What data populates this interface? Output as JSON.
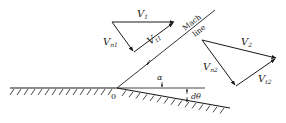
{
  "diagram": {
    "labels": {
      "v1": "V",
      "v1_sub": "1",
      "vn1": "V",
      "vn1_sub": "n1",
      "vt1": "V",
      "vt1_sub": "t1",
      "v2": "V",
      "v2_sub": "2",
      "vn2": "V",
      "vn2_sub": "n2",
      "vt2": "V",
      "vt2_sub": "t2",
      "mach_line_1": "Mach",
      "mach_line_2": "line",
      "alpha": "α",
      "dtheta": "dθ",
      "corner": "0"
    },
    "colors": {
      "ink": "#1a1a1a",
      "background": "#ffffff"
    }
  }
}
